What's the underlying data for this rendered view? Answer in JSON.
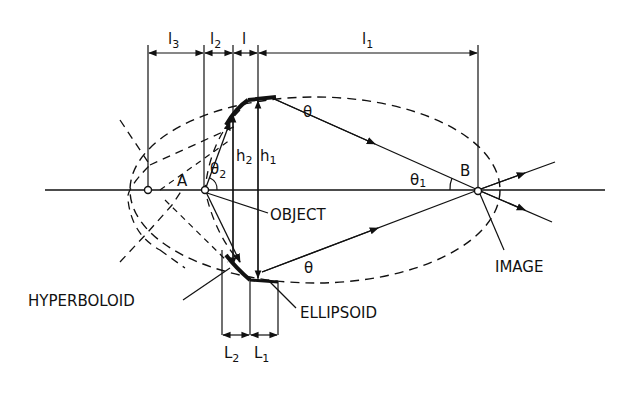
{
  "diagram": {
    "type": "optical-schematic",
    "points": {
      "A": "A",
      "B": "B"
    },
    "dimensions": {
      "l3": "l",
      "l3_sub": "3",
      "l2": "l",
      "l2_sub": "2",
      "l": "l",
      "l1": "l",
      "l1_sub": "1",
      "h2": "h",
      "h2_sub": "2",
      "h1": "h",
      "h1_sub": "1",
      "L2": "L",
      "L2_sub": "2",
      "L1": "L",
      "L1_sub": "1"
    },
    "angles": {
      "theta_top": "θ",
      "theta_bottom": "θ",
      "theta1": "θ",
      "theta1_sub": "1",
      "theta2": "θ",
      "theta2_sub": "2"
    },
    "callouts": {
      "object": "OBJECT",
      "image": "IMAGE",
      "hyperboloid": "HYPERBOLOID",
      "ellipsoid": "ELLIPSOID"
    },
    "colors": {
      "ink": "#111111",
      "background": "#ffffff"
    }
  }
}
